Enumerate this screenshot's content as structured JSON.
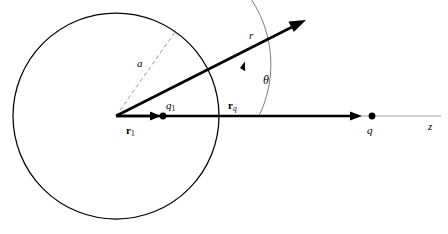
{
  "figure": {
    "background_color": "#ffffff",
    "stroke_color": "#000000",
    "faint_color": "#999999",
    "labels": {
      "radius": "a",
      "field_point_vector": "r",
      "angle": "θ",
      "image_charge": "q",
      "image_charge_sub": "1",
      "image_position_vector": "r",
      "image_position_vector_sub": "1",
      "source_position_vector": "r",
      "source_position_vector_sub": "q",
      "source_charge": "q",
      "axis": "z"
    },
    "geometry": {
      "origin": {
        "x": 116,
        "y": 116
      },
      "sphere_radius": 103,
      "sphere_label_angle_deg": 55,
      "r1_arrow_tip": {
        "x": 160,
        "y": 116
      },
      "q1_dot": {
        "x": 163,
        "y": 116
      },
      "rq_arrow_tip": {
        "x": 361,
        "y": 116
      },
      "q_dot": {
        "x": 371,
        "y": 116
      },
      "r_arrow_tip": {
        "x": 306,
        "y": 20
      },
      "r_arrow_angle_deg": 26.8,
      "z_axis_end": {
        "x": 441,
        "y": 116
      },
      "theta_arc_radius": 118
    }
  }
}
